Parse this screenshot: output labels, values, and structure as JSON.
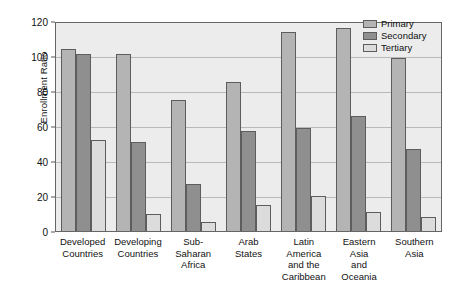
{
  "chart_data": {
    "type": "bar",
    "title": "",
    "xlabel": "",
    "ylabel": "Enrollment Ratio",
    "ylim": [
      0,
      120
    ],
    "yticks": [
      0,
      20,
      40,
      60,
      80,
      100,
      120
    ],
    "grid": true,
    "legend_position": "top-right",
    "categories": [
      "Developed Countries",
      "Developing Countries",
      "Sub-Saharan Africa",
      "Arab States",
      "Latin America and the Caribbean",
      "Eastern Asia and Oceania",
      "Southern Asia"
    ],
    "category_lines": [
      [
        "Developed",
        "Countries"
      ],
      [
        "Developing",
        "Countries"
      ],
      [
        "Sub-Saharan",
        "Africa"
      ],
      [
        "Arab",
        "States"
      ],
      [
        "Latin",
        "America",
        "and the",
        "Caribbean"
      ],
      [
        "Eastern Asia",
        "and Oceania"
      ],
      [
        "Southern",
        "Asia"
      ]
    ],
    "series": [
      {
        "name": "Primary",
        "color": "#b4b4b4",
        "values": [
          104,
          101,
          75,
          85,
          114,
          116,
          99
        ]
      },
      {
        "name": "Secondary",
        "color": "#8f8f8f",
        "values": [
          101,
          51,
          27,
          57,
          59,
          66,
          47
        ]
      },
      {
        "name": "Tertiary",
        "color": "#dcdcdc",
        "values": [
          52,
          10,
          5,
          15,
          20,
          11,
          8
        ]
      }
    ]
  },
  "colors": {
    "plot_background": "#ececec",
    "gridline": "#b9b9b9",
    "axis": "#666666",
    "bar_outline": "#5d5d5d",
    "text": "#111111"
  }
}
